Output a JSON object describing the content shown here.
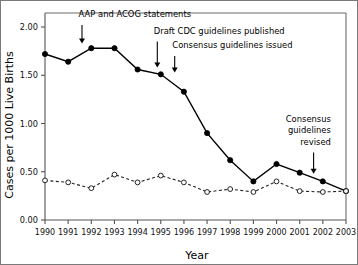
{
  "figure": {
    "background_color": "#ffffff",
    "border_color": "#7a7a7a"
  },
  "chart_data": {
    "type": "line",
    "title": "",
    "xlabel": "Year",
    "ylabel": "Cases per 1000 Live Births",
    "categories": [
      "1990",
      "1991",
      "1992",
      "1993",
      "1994",
      "1995",
      "1996",
      "1997",
      "1998",
      "1999",
      "2000",
      "2001",
      "2002",
      "2003"
    ],
    "x": [
      1990,
      1991,
      1992,
      1993,
      1994,
      1995,
      1996,
      1997,
      1998,
      1999,
      2000,
      2001,
      2002,
      2003
    ],
    "xlim": [
      1990,
      2003
    ],
    "ylim": [
      0.0,
      2.15
    ],
    "ytick_labels": [
      "0.00",
      "0.50",
      "1.00",
      "1.50",
      "2.00"
    ],
    "ytick_values": [
      0.0,
      0.5,
      1.0,
      1.5,
      2.0
    ],
    "grid": false,
    "legend_position": "none",
    "series": [
      {
        "name": "Early-onset disease",
        "style": "solid",
        "marker": "filled-circle",
        "color": "#000000",
        "values": [
          1.72,
          1.64,
          1.78,
          1.78,
          1.56,
          1.51,
          1.33,
          0.9,
          0.62,
          0.4,
          0.58,
          0.49,
          0.4,
          0.3
        ]
      },
      {
        "name": "Late-onset disease",
        "style": "dashed",
        "marker": "open-circle",
        "color": "#222222",
        "values": [
          0.41,
          0.39,
          0.33,
          0.47,
          0.39,
          0.46,
          0.39,
          0.29,
          0.32,
          0.29,
          0.4,
          0.3,
          0.29,
          0.3
        ]
      }
    ],
    "annotations": [
      {
        "id": "aap-acog",
        "text": "AAP and ACOG statements",
        "text_anchor": "start",
        "text_x": 1991.45,
        "text_y": 2.1,
        "arrow_x": 1991.6,
        "arrow_y_top": 2.02,
        "arrow_y_tip": 1.83
      },
      {
        "id": "draft-cdc",
        "text": "Draft CDC guidelines published",
        "text_anchor": "start",
        "text_x": 1994.7,
        "text_y": 1.93,
        "arrow_x": 1994.85,
        "arrow_y_top": 1.85,
        "arrow_y_tip": 1.58
      },
      {
        "id": "consensus-issued",
        "text": "Consensus guidelines issued",
        "text_anchor": "start",
        "text_x": 1995.5,
        "text_y": 1.78,
        "arrow_x": 1995.6,
        "arrow_y_top": 1.7,
        "arrow_y_tip": 1.53
      },
      {
        "id": "consensus-revised-line1",
        "text": "Consensus",
        "text_anchor": "end",
        "text_x": 2002.35,
        "text_y": 1.02,
        "arrow_x": null,
        "arrow_y_top": null,
        "arrow_y_tip": null
      },
      {
        "id": "consensus-revised-line2",
        "text": "guidelines",
        "text_anchor": "end",
        "text_x": 2002.35,
        "text_y": 0.9,
        "arrow_x": null,
        "arrow_y_top": null,
        "arrow_y_tip": null
      },
      {
        "id": "consensus-revised-line3",
        "text": "revised",
        "text_anchor": "end",
        "text_x": 2002.35,
        "text_y": 0.78,
        "arrow_x": 2001.6,
        "arrow_y_top": 0.7,
        "arrow_y_tip": 0.48
      }
    ]
  },
  "labels": {
    "ylabel": "Cases per 1000 Live Births",
    "xlabel": "Year",
    "ytick_0": "0.00",
    "ytick_1": "0.50",
    "ytick_2": "1.00",
    "ytick_3": "1.50",
    "ytick_4": "2.00",
    "xtick_0": "1990",
    "xtick_1": "1991",
    "xtick_2": "1992",
    "xtick_3": "1993",
    "xtick_4": "1994",
    "xtick_5": "1995",
    "xtick_6": "1996",
    "xtick_7": "1997",
    "xtick_8": "1998",
    "xtick_9": "1999",
    "xtick_10": "2000",
    "xtick_11": "2001",
    "xtick_12": "2002",
    "xtick_13": "2003",
    "annot_aap": "AAP and ACOG statements",
    "annot_draft": "Draft CDC guidelines published",
    "annot_consensus": "Consensus guidelines issued",
    "annot_revised_1": "Consensus",
    "annot_revised_2": "guidelines",
    "annot_revised_3": "revised"
  }
}
